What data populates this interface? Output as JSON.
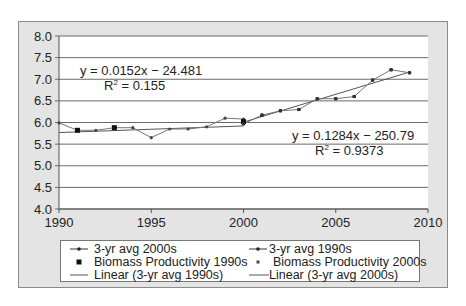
{
  "chart_data": {
    "type": "line",
    "title": "",
    "xlabel": "",
    "ylabel": "",
    "xlim": [
      1990,
      2010
    ],
    "ylim": [
      4.0,
      8.0
    ],
    "x_ticks": [
      "1990",
      "1995",
      "2000",
      "2005",
      "2010"
    ],
    "y_ticks": [
      "4.0",
      "4.5",
      "5.0",
      "5.5",
      "6.0",
      "6.5",
      "7.0",
      "7.5",
      "8.0"
    ],
    "grid": "horizontal",
    "legend_position": "bottom",
    "series": [
      {
        "name": "3-yr avg 1990s",
        "x": [
          1990,
          1991,
          1992,
          1993,
          1994,
          1995,
          1996,
          1997,
          1998,
          1999,
          2000
        ],
        "values": [
          5.99,
          5.82,
          5.82,
          5.88,
          5.88,
          5.65,
          5.85,
          5.85,
          5.9,
          6.1,
          6.08
        ]
      },
      {
        "name": "3-yr avg 2000s",
        "x": [
          2000,
          2001,
          2002,
          2003,
          2004,
          2005,
          2006,
          2007,
          2008,
          2009
        ],
        "values": [
          5.97,
          6.17,
          6.27,
          6.3,
          6.55,
          6.55,
          6.6,
          6.98,
          7.22,
          7.15
        ]
      },
      {
        "name": "Biomass Productivity 1990s",
        "x": [
          1991,
          1993,
          2000
        ],
        "values": [
          5.82,
          5.88,
          6.02
        ]
      },
      {
        "name": "Biomass Productivity 2000s",
        "x": [
          2000,
          2001,
          2002,
          2003,
          2004,
          2005,
          2006,
          2007,
          2008,
          2009
        ],
        "values": [
          5.97,
          6.17,
          6.27,
          6.3,
          6.55,
          6.55,
          6.6,
          6.98,
          7.22,
          7.15
        ]
      },
      {
        "name": "Linear (3-yr avg 1990s)",
        "x": [
          1990,
          2000
        ],
        "values": [
          5.768,
          5.92
        ]
      },
      {
        "name": "Linear (3-yr avg 2000s)",
        "x": [
          2000,
          2009
        ],
        "values": [
          6.01,
          7.166
        ]
      }
    ],
    "annotations": [
      {
        "text": "y = 0.0152x − 24.481",
        "r2": "R² = 0.155"
      },
      {
        "text": "y = 0.1284x − 250.79",
        "r2": "R² = 0.9373"
      }
    ]
  },
  "eq1": {
    "line": "y = 0.0152x − 24.481",
    "r2_prefix": "R",
    "r2_rest": " = 0.155"
  },
  "eq2": {
    "line": "y = 0.1284x − 250.79",
    "r2_prefix": "R",
    "r2_rest": " = 0.9373"
  },
  "legend": [
    {
      "label": "3-yr avg 2000s"
    },
    {
      "label": "3-yr avg 1990s"
    },
    {
      "label": "Biomass Productivity 1990s"
    },
    {
      "label": "Biomass Productivity 2000s"
    },
    {
      "label": "Linear (3-yr avg 1990s)"
    },
    {
      "label": "Linear (3-yr avg 2000s)"
    }
  ]
}
